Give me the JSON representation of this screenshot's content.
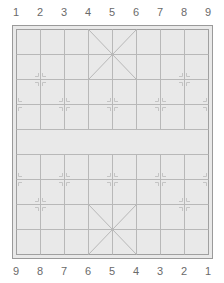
{
  "board": {
    "type": "xiangqi",
    "colors": {
      "background": "#e9e9e9",
      "border": "#9a9a9a",
      "grid": "#b8b8b8",
      "label": "#6a6a6a"
    },
    "columns": 9,
    "rows": 10
  },
  "top_labels": [
    "1",
    "2",
    "3",
    "4",
    "5",
    "6",
    "7",
    "8",
    "9"
  ],
  "bottom_labels": [
    "9",
    "8",
    "7",
    "6",
    "5",
    "4",
    "3",
    "2",
    "1"
  ]
}
